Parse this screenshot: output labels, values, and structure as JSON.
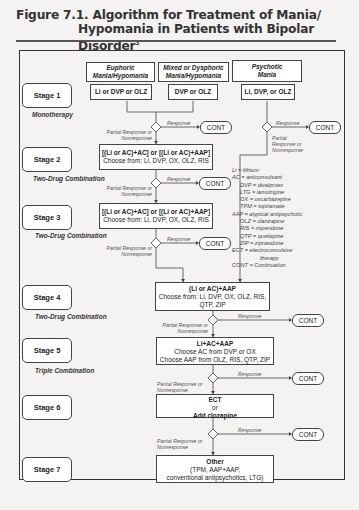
{
  "title": {
    "line1": "Figure 7.1. Algorithm for Treatment of Mania/",
    "line2": "Hypomania in Patients with Bipolar Disorder",
    "superscript": "3"
  },
  "columns": [
    {
      "header1": "Euphoric",
      "header2": "Mania/Hypomania",
      "drug": "Li or DVP or OLZ"
    },
    {
      "header1": "Mixed or Dysphoric",
      "header2": "Mania/Hypomania",
      "drug": "DVP or OLZ"
    },
    {
      "header1": "Psychotic",
      "header2": "Mania",
      "drug": "Li, DVP, or OLZ"
    }
  ],
  "stages": [
    {
      "label": "Stage 1",
      "subtitle": "Monotherapy"
    },
    {
      "label": "Stage 2",
      "subtitle": "Two-Drug Combination",
      "box_line1": "[(Li or AC)+AC] or [(Li or AC)+AAP]",
      "box_line2": "Choose from: Li, DVP, OX, OLZ, RIS"
    },
    {
      "label": "Stage 3",
      "subtitle": "Two-Drug Combination",
      "box_line1": "[(Li or AC)+AC] or [(Li or AC)+AAP]",
      "box_line2": "Choose from: Li, DVP, OX, OLZ, RIS"
    },
    {
      "label": "Stage 4",
      "subtitle": "Two-Drug Combination",
      "box_line1": "(Li or AC)+AAP",
      "box_line2": "Choose from: Li, DVP, OX, OLZ, RIS,",
      "box_line3": "QTP, ZIP"
    },
    {
      "label": "Stage 5",
      "subtitle": "Triple Combination",
      "box_line1": "Li+AC+AAP",
      "box_line2": "Choose AC from DVP or OX",
      "box_line3": "Choose AAP from OLZ, RIS, QTP, ZIP"
    },
    {
      "label": "Stage 6",
      "box_line1": "ECT",
      "box_line2": "or",
      "box_line3": "Add clozapine"
    },
    {
      "label": "Stage 7",
      "box_line1": "Other",
      "box_line2": "(TPM, AAP+AAP,",
      "box_line3": "conventional antipsychotics, LTG)"
    }
  ],
  "flow_labels": {
    "response": "Response",
    "partial": "Partial Response or Nonresponse",
    "partial_a": "Partial Response or",
    "partial_b": "Nonresponse",
    "partial_c": "Partial",
    "partial_d": "Response or",
    "cont": "CONT"
  },
  "legend": [
    "Li = lithium",
    "AC = anticonvulsant",
    "DVP = divalproex",
    "LTG = lamotrigine",
    "OX = oxcarbazepine",
    "TPM = topiramate",
    "AAP = atypical antipsychotic",
    "OLZ = olanzapine",
    "RIS = risperidone",
    "QTP = quetiapine",
    "ZIP = ziprasidone",
    "ECT = electroconvulsive",
    "therapy",
    "CONT = Continuation"
  ]
}
